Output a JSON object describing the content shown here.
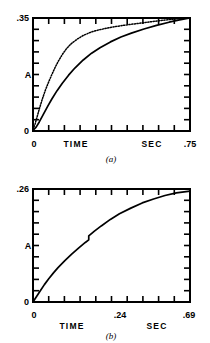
{
  "figure": {
    "panels": [
      {
        "id": "a",
        "caption": "(a)",
        "y_axis": {
          "label": "A",
          "max_label": ".35",
          "min_label": "0"
        },
        "x_axis": {
          "origin_label": "0",
          "name_label": "TIME",
          "unit_label": "SEC",
          "max_label": ".75"
        }
      },
      {
        "id": "b",
        "caption": "(b)",
        "y_axis": {
          "label": "A",
          "max_label": ".26",
          "min_label": "0"
        },
        "x_axis": {
          "origin_label": "0",
          "name_label": "TIME",
          "unit_label": "SEC",
          "mid_label": ".24",
          "max_label": ".69"
        }
      }
    ]
  },
  "chart_data": [
    {
      "type": "line",
      "title": "(a)",
      "xlabel": "TIME  SEC",
      "ylabel": "A",
      "xlim": [
        0,
        0.75
      ],
      "ylim": [
        0,
        0.35
      ],
      "xticks": [
        0,
        0.075,
        0.15,
        0.225,
        0.3,
        0.375,
        0.45,
        0.525,
        0.6,
        0.675,
        0.75
      ],
      "xticklabels": [
        "0",
        "",
        "",
        "",
        "",
        "",
        "",
        "",
        "",
        "",
        ".75"
      ],
      "yticks": [
        0,
        0.035,
        0.07,
        0.105,
        0.14,
        0.175,
        0.21,
        0.245,
        0.28,
        0.315,
        0.35
      ],
      "yticklabels": [
        "0",
        "",
        "",
        "",
        "",
        "",
        "",
        "",
        "",
        "",
        ".35"
      ],
      "grid": false,
      "legend": null,
      "series": [
        {
          "name": "fast-rise curve (dotted)",
          "style": "dotted",
          "x": [
            0.0,
            0.01,
            0.02,
            0.03,
            0.045,
            0.06,
            0.075,
            0.09,
            0.105,
            0.12,
            0.14,
            0.16,
            0.18,
            0.21,
            0.24,
            0.28,
            0.32,
            0.38,
            0.44,
            0.5,
            0.56,
            0.62,
            0.68,
            0.75
          ],
          "y": [
            0.005,
            0.022,
            0.045,
            0.068,
            0.1,
            0.128,
            0.152,
            0.175,
            0.196,
            0.215,
            0.237,
            0.255,
            0.269,
            0.284,
            0.296,
            0.307,
            0.314,
            0.322,
            0.328,
            0.333,
            0.338,
            0.343,
            0.347,
            0.35
          ]
        },
        {
          "name": "slow-rise curve (solid)",
          "style": "solid",
          "x": [
            0.0,
            0.015,
            0.03,
            0.05,
            0.07,
            0.09,
            0.115,
            0.14,
            0.17,
            0.2,
            0.24,
            0.28,
            0.32,
            0.37,
            0.42,
            0.47,
            0.53,
            0.59,
            0.65,
            0.7,
            0.75
          ],
          "y": [
            0.002,
            0.012,
            0.028,
            0.052,
            0.076,
            0.099,
            0.125,
            0.148,
            0.173,
            0.195,
            0.22,
            0.241,
            0.258,
            0.276,
            0.291,
            0.303,
            0.316,
            0.327,
            0.337,
            0.344,
            0.35
          ]
        }
      ]
    },
    {
      "type": "line",
      "title": "(b)",
      "xlabel": "TIME  SEC",
      "ylabel": "A",
      "xlim": [
        0,
        0.69
      ],
      "ylim": [
        0,
        0.26
      ],
      "xticks": [
        0,
        0.069,
        0.138,
        0.207,
        0.276,
        0.345,
        0.414,
        0.483,
        0.552,
        0.621,
        0.69
      ],
      "xticklabels": [
        "0",
        "",
        "",
        "",
        "",
        "",
        "",
        "",
        "",
        "",
        ".69"
      ],
      "xtick_annotated": [
        {
          "value": 0.24,
          "label": ".24"
        }
      ],
      "yticks": [
        0,
        0.026,
        0.052,
        0.078,
        0.104,
        0.13,
        0.156,
        0.182,
        0.208,
        0.234,
        0.26
      ],
      "yticklabels": [
        "0",
        "",
        "",
        "",
        "",
        "",
        "",
        "",
        "",
        "",
        ".26"
      ],
      "grid": false,
      "legend": null,
      "series": [
        {
          "name": "response curve with discontinuity at .24",
          "style": "solid",
          "x": [
            0.0,
            0.015,
            0.03,
            0.05,
            0.07,
            0.09,
            0.11,
            0.14,
            0.17,
            0.2,
            0.23,
            0.245,
            0.245,
            0.27,
            0.3,
            0.34,
            0.38,
            0.43,
            0.48,
            0.53,
            0.58,
            0.63,
            0.69
          ],
          "y": [
            0.0,
            0.012,
            0.024,
            0.04,
            0.054,
            0.067,
            0.079,
            0.095,
            0.11,
            0.124,
            0.137,
            0.143,
            0.152,
            0.163,
            0.175,
            0.19,
            0.203,
            0.216,
            0.228,
            0.237,
            0.245,
            0.251,
            0.255
          ]
        }
      ]
    }
  ]
}
